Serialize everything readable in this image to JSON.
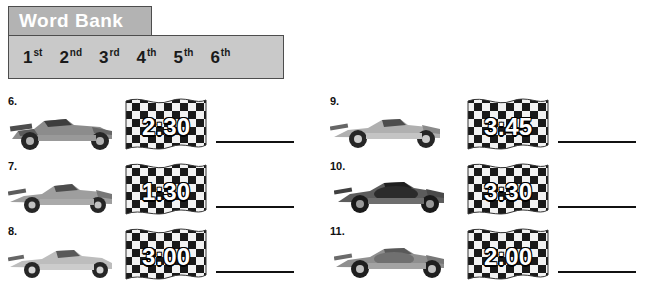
{
  "word_bank": {
    "title": "Word Bank",
    "options": [
      {
        "num": "1",
        "suffix": "st"
      },
      {
        "num": "2",
        "suffix": "nd"
      },
      {
        "num": "3",
        "suffix": "rd"
      },
      {
        "num": "4",
        "suffix": "th"
      },
      {
        "num": "5",
        "suffix": "th"
      },
      {
        "num": "6",
        "suffix": "th"
      }
    ]
  },
  "colors": {
    "title_bg": "#b3b3b3",
    "body_bg": "#c9c9c9",
    "border": "#4d4d4d",
    "text": "#1a1a1a",
    "flag_dark": "#1a1a1a",
    "flag_light": "#f2f2f2"
  },
  "problems": [
    {
      "number": "6.",
      "time": "2:30",
      "answer": ""
    },
    {
      "number": "7.",
      "time": "1:30",
      "answer": ""
    },
    {
      "number": "8.",
      "time": "3:00",
      "answer": ""
    },
    {
      "number": "9.",
      "time": "3:45",
      "answer": ""
    },
    {
      "number": "10.",
      "time": "3:30",
      "answer": ""
    },
    {
      "number": "11.",
      "time": "2:00",
      "answer": ""
    }
  ]
}
